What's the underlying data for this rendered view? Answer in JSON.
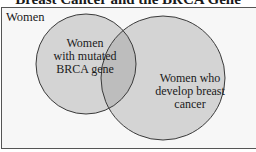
{
  "title": "Breast Cancer and the BRCA Gene",
  "universe": {
    "label": "Women"
  },
  "sets": [
    {
      "label_lines": [
        "Women",
        "with mutated",
        "BRCA gene"
      ]
    },
    {
      "label_lines": [
        "Women who",
        "develop breast",
        "cancer"
      ]
    }
  ],
  "colors": {
    "circle_fill": "#d4d4d4",
    "overlap_fill": "#bdbdbd",
    "stroke": "#3a3a3a",
    "background": "#f7f7f7"
  }
}
